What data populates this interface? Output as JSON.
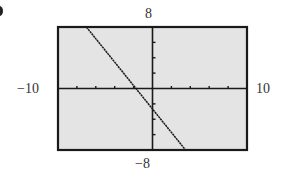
{
  "chart_data": {
    "type": "line",
    "title": "",
    "xlabel": "",
    "ylabel": "",
    "xlim": [
      -10,
      10
    ],
    "ylim": [
      -8,
      8
    ],
    "window_labels": {
      "ymax": "8",
      "ymin": "−8",
      "xmin": "−10",
      "xmax": "10"
    },
    "xscale": 2,
    "yscale": 2,
    "grid": false,
    "series": [
      {
        "name": "line",
        "x": [
          -7,
          3.5
        ],
        "y": [
          8,
          -8
        ]
      }
    ],
    "colors": {
      "background": "#e4e4e4",
      "frame": "#1a1a1a",
      "line": "#1a1a1a"
    }
  }
}
